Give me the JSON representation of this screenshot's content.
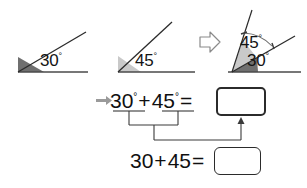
{
  "figure": {
    "degree_symbol": "°",
    "angles": [
      {
        "id": "angle-30",
        "value": "30",
        "unit": "°",
        "label": "30°",
        "wedge_color": "#6f6f6f",
        "ray_color": "#2b2b2b",
        "baseline_color": "#4a4a4a"
      },
      {
        "id": "angle-45",
        "value": "45",
        "unit": "°",
        "label": "45°",
        "wedge_color": "#c9c9c9",
        "ray_color": "#2b2b2b",
        "baseline_color": "#4a4a4a"
      }
    ],
    "transform_arrow": {
      "name": "double-right-arrow",
      "glyph": "⇒",
      "color": "#8a8a8a"
    },
    "combined": {
      "id": "angle-combined",
      "lower_label": "30°",
      "upper_label": "45°",
      "lower_value": "30",
      "upper_value": "45",
      "total_value": "75",
      "arc_color": "#6a6a6a"
    }
  },
  "equations": {
    "lead_arrow": {
      "name": "solid-right-arrow",
      "color": "#9a9a9a"
    },
    "row1": {
      "id": "equation-with-degrees",
      "term1": "30",
      "term1_unit": "°",
      "operator": "+",
      "term2": "45",
      "term2_unit": "°",
      "equals": "=",
      "answer_value": "",
      "answer_placeholder": ""
    },
    "row2": {
      "id": "equation-plain",
      "term1": "30",
      "operator": "+",
      "term2": "45",
      "equals": "=",
      "answer_value": "",
      "answer_placeholder": ""
    },
    "connectors": {
      "name": "bracket-connector-lines",
      "color": "#3a3a3a"
    },
    "result_arrow": {
      "name": "up-arrow",
      "color": "#3a3a3a"
    }
  },
  "colors": {
    "ink": "#1a1a1a",
    "box_border": "#2b2b2b",
    "wedge_dark": "#6f6f6f",
    "wedge_light": "#c9c9c9",
    "gray_accent": "#9a9a9a"
  }
}
